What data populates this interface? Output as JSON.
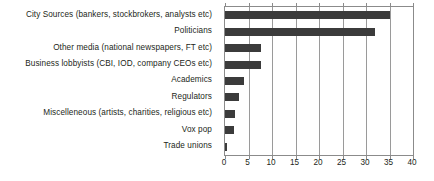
{
  "chart_data": {
    "type": "bar",
    "orientation": "horizontal",
    "title": "",
    "subtitle": "",
    "xlabel": "",
    "ylabel": "",
    "xlim": [
      0,
      40
    ],
    "xticks": [
      0,
      5,
      10,
      15,
      20,
      25,
      30,
      35,
      40
    ],
    "grid": "vertical",
    "legend": "none",
    "bar_color": "#3b3b3b",
    "axis_color": "#8b8b8b",
    "text_color": "#231f20",
    "categories": [
      "City Sources (bankers, stockbrokers, analysts etc)",
      "Politicians",
      "Other media (national newspapers, FT etc)",
      "Business lobbyists (CBI, IOD, company CEOs etc)",
      "Academics",
      "Regulators",
      "Miscelleneous (artists, charities, religious etc)",
      "Vox pop",
      "Trade unions"
    ],
    "values": [
      35,
      32,
      7.7,
      7.7,
      4,
      3,
      2.2,
      2,
      0.3
    ]
  }
}
